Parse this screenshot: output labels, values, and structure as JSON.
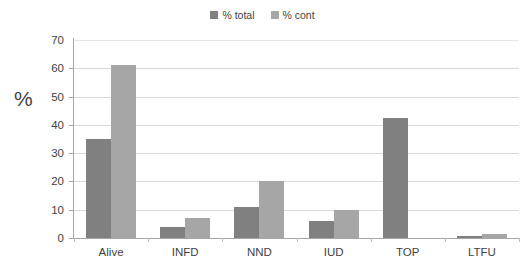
{
  "chart_data": {
    "type": "bar",
    "title": "",
    "xlabel": "",
    "ylabel": "%",
    "ylim": [
      0,
      70
    ],
    "ytick_step": 10,
    "yticks": [
      70,
      60,
      50,
      40,
      30,
      20,
      10,
      0
    ],
    "grid": true,
    "legend_position": "top-center",
    "categories": [
      "Alive",
      "INFD",
      "NND",
      "IUD",
      "TOP",
      "LTFU"
    ],
    "series": [
      {
        "name": "% total",
        "color": "#808080",
        "values": [
          35,
          4,
          11,
          6,
          42.5,
          0.6
        ]
      },
      {
        "name": "% cont",
        "color": "#a6a6a6",
        "values": [
          61,
          7,
          20,
          10,
          0,
          1.5
        ]
      }
    ]
  },
  "legend": {
    "items": [
      {
        "label": "% total",
        "color": "#808080"
      },
      {
        "label": "% cont",
        "color": "#a6a6a6"
      }
    ]
  },
  "axis": {
    "y_title": "%"
  },
  "colors": {
    "series_total": "#808080",
    "series_cont": "#a6a6a6",
    "gridline": "#d9d9d9",
    "axis": "#a6a6a6",
    "text": "#3f3f3f",
    "background": "#ffffff"
  }
}
